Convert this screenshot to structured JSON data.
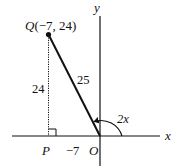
{
  "diagram": {
    "axes": {
      "x_label": "x",
      "y_label": "y",
      "origin_label": "O"
    },
    "point_q": {
      "name": "Q",
      "coords": "(−7, 24)",
      "x": -7,
      "y": 24
    },
    "point_p": {
      "name": "P"
    },
    "labels": {
      "hypotenuse": "25",
      "vertical_side": "24",
      "horizontal_side": "−7",
      "angle": "2x"
    },
    "colors": {
      "stroke": "#111111",
      "background": "#ffffff"
    }
  }
}
